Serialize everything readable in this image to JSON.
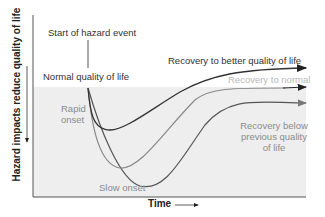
{
  "diagram": {
    "title": "",
    "y_axis_label": "Hazard impacts reduce quality of life",
    "x_axis_label": "Time",
    "annotations": {
      "start_event": "Start of hazard event",
      "normal_quality": "Normal quality of life",
      "rapid_onset_line1": "Rapid",
      "rapid_onset_line2": "onset",
      "slow_onset": "Slow onset",
      "recovery_better": "Recovery to better quality of life",
      "recovery_normal": "Recovery to normal",
      "recovery_below_line1": "Recovery below",
      "recovery_below_line2": "previous quality",
      "recovery_below_line3": "of life"
    },
    "colors": {
      "shaded_area": "#eeeeee",
      "curve_better": "#333333",
      "curve_normal": "#888888",
      "curve_below": "#555555",
      "axis": "#555555"
    }
  }
}
